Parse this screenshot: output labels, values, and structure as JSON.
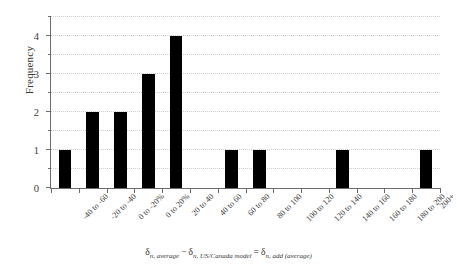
{
  "chart_data": {
    "type": "bar",
    "title": "",
    "subtitle": "",
    "xlabel": "δn, average − δn, US/Canada model = δn, add (average)",
    "ylabel": "Frequency",
    "categories": [
      "-40 to -60",
      "-20 to -40",
      "0 to -20%",
      "0 to 20%",
      "20 to 40",
      "40 to 60",
      "60 to 80",
      "80 to 100",
      "100 to 120",
      "120 to 140",
      "140 to 160",
      "160 to 180",
      "180 to 200",
      "200+"
    ],
    "values": [
      1,
      2,
      2,
      3,
      4,
      0,
      1,
      1,
      0,
      0,
      1,
      0,
      0,
      1
    ],
    "ylim": [
      0,
      4.5
    ],
    "y_major_ticks": [
      0,
      1,
      2,
      3,
      4
    ],
    "y_minor_ticks": [
      0.5,
      1.5,
      2.5,
      3.5,
      4.5
    ],
    "y_tick_labels": [
      "0",
      "1",
      "2",
      "3",
      "4"
    ],
    "grid": true,
    "gridline_style": "dotted",
    "legend": null,
    "legend_position": "none",
    "bar_color": "#000000",
    "axis_color": "#6b6b6b",
    "grid_color": "#cfcfcf",
    "background_color": "#ffffff",
    "x_label_rotation_deg": -45
  },
  "xaxis_title_parts": {
    "delta1": "δ",
    "sub1": "n, average",
    "minus": "−",
    "delta2": "δ",
    "sub2": "n, US/Canada model",
    "equals": "=",
    "delta3": "δ",
    "sub3": "n, add (average)"
  }
}
